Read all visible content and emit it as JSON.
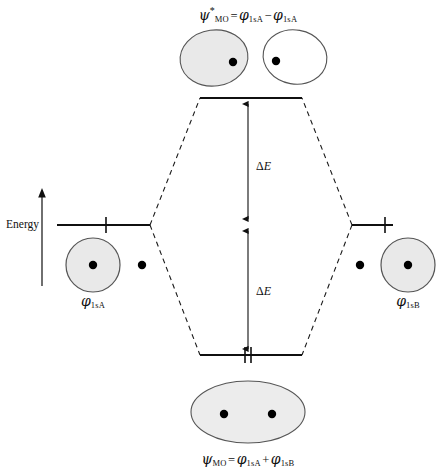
{
  "figure": {
    "type": "molecular-orbital-energy-diagram",
    "width": 447,
    "height": 473,
    "background_color": "#ffffff",
    "line_color": "#1a1a1a",
    "orbital_fill_shaded": "#e8e8e8",
    "orbital_fill_empty": "#ffffff",
    "orbital_stroke": "#4a4a4a",
    "nucleus_color": "#000000"
  },
  "axis": {
    "label": "Energy",
    "direction": "up",
    "arrow_icon": "up-arrow-icon"
  },
  "labels": {
    "antibonding_formula": {
      "psi": "ψ",
      "psi_sub": "MO",
      "psi_sup": "*",
      "equals": "=",
      "term1_phi": "φ",
      "term1_sub": "1sA",
      "operator": "−",
      "term2_phi": "φ",
      "term2_sub": "1sA",
      "plain": "ψ*MO = φ1sA − φ1sA"
    },
    "bonding_formula": {
      "psi": "ψ",
      "psi_sub": "MO",
      "equals": "=",
      "term1_phi": "φ",
      "term1_sub": "1sA",
      "operator": "+",
      "term2_phi": "φ",
      "term2_sub": "1sB",
      "plain": "ψMO = φ1sA + φ1sB"
    },
    "left_ao": {
      "phi": "φ",
      "sub": "1sA",
      "plain": "φ1sA"
    },
    "right_ao": {
      "phi": "φ",
      "sub": "1sB",
      "plain": "φ1sB"
    },
    "delta_e_upper": {
      "delta": "Δ",
      "symbol": "E",
      "plain": "ΔE"
    },
    "delta_e_lower": {
      "delta": "Δ",
      "symbol": "E",
      "plain": "ΔE"
    }
  },
  "levels": {
    "antibonding": {
      "name": "antibonding-level",
      "y": 98,
      "x_start": 200,
      "x_end": 302,
      "electrons": 0,
      "electron_ticks": []
    },
    "atomic_left": {
      "name": "left-atomic-level",
      "y": 225,
      "x_start": 57,
      "x_end": 150,
      "electrons": 1,
      "electron_ticks": [
        106
      ]
    },
    "atomic_right": {
      "name": "right-atomic-level",
      "y": 225,
      "x_start": 352,
      "x_end": 393,
      "electrons": 1,
      "electron_ticks": [
        385
      ]
    },
    "bonding": {
      "name": "bonding-level",
      "y": 355,
      "x_start": 200,
      "x_end": 302,
      "electrons": 2,
      "electron_ticks": [
        245,
        251
      ]
    }
  },
  "orbitals": {
    "antibonding_left_lobe": {
      "name": "antibonding-left-lobe",
      "cx": 214,
      "cy": 58,
      "rx": 34,
      "ry": 28,
      "shaded": true,
      "nucleus_x": 233,
      "nucleus_y": 62
    },
    "antibonding_right_lobe": {
      "name": "antibonding-right-lobe",
      "cx": 295,
      "cy": 57,
      "rx": 32,
      "ry": 27,
      "shaded": false,
      "nucleus_x": 276,
      "nucleus_y": 61
    },
    "bonding_lobe": {
      "name": "bonding-combined-lobe",
      "cx": 248,
      "cy": 412,
      "rx": 57,
      "ry": 31,
      "shaded": true,
      "nuclei": [
        {
          "x": 224,
          "y": 414
        },
        {
          "x": 272,
          "y": 414
        }
      ]
    },
    "left_atomic_orbital": {
      "name": "left-atomic-orbital",
      "cx": 93,
      "cy": 265,
      "r": 27,
      "shaded": true,
      "nucleus_x": 93,
      "nucleus_y": 265
    },
    "left_lone_nucleus": {
      "name": "left-partner-nucleus",
      "x": 142,
      "y": 265
    },
    "right_atomic_orbital": {
      "name": "right-atomic-orbital",
      "cx": 408,
      "cy": 265,
      "r": 27,
      "shaded": true,
      "nucleus_x": 408,
      "nucleus_y": 265
    },
    "right_lone_nucleus": {
      "name": "right-partner-nucleus",
      "x": 360,
      "y": 265
    }
  },
  "connectors": {
    "style": "dashed",
    "lines": [
      {
        "name": "left-to-antibonding",
        "x1": 150,
        "y1": 225,
        "x2": 200,
        "y2": 98
      },
      {
        "name": "left-to-bonding",
        "x1": 150,
        "y1": 225,
        "x2": 200,
        "y2": 355
      },
      {
        "name": "right-to-antibonding",
        "x1": 352,
        "y1": 225,
        "x2": 302,
        "y2": 98
      },
      {
        "name": "right-to-bonding",
        "x1": 352,
        "y1": 225,
        "x2": 302,
        "y2": 355
      }
    ]
  },
  "delta_arrows": {
    "upper": {
      "name": "delta-e-upper-arrow",
      "x": 248,
      "y_top": 99,
      "y_bottom": 224
    },
    "lower": {
      "name": "delta-e-lower-arrow",
      "x": 248,
      "y_top": 226,
      "y_bottom": 354
    }
  }
}
